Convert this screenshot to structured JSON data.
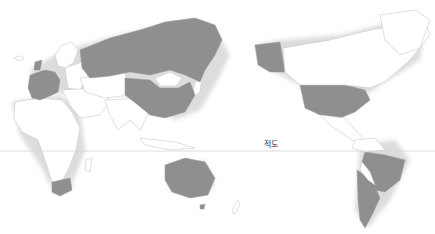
{
  "map": {
    "projection": "pacific-centered world map",
    "highlight_color": "#8f8f8f",
    "land_color": "#ffffff",
    "border_color": "#c9c9c9",
    "equator": {
      "label": "적도",
      "line_color": "#d6d6d6"
    },
    "highlighted_countries": [
      "Russia",
      "China",
      "United States",
      "Alaska (US)",
      "Brazil",
      "Argentina",
      "Chile",
      "Australia",
      "South Africa",
      "France",
      "Spain",
      "Portugal",
      "Italy",
      "Germany",
      "United Kingdom"
    ],
    "caption": ""
  }
}
